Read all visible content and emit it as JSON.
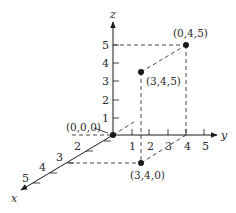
{
  "diagram": {
    "type": "3d-coordinate-system",
    "colors": {
      "ink": "#1a1a1a",
      "background": "#ffffff"
    },
    "axes": {
      "x": {
        "label": "x",
        "ticks": [
          "2",
          "3",
          "4",
          "5"
        ]
      },
      "y": {
        "label": "y",
        "ticks": [
          "1",
          "2",
          "3",
          "4",
          "5"
        ]
      },
      "z": {
        "label": "z",
        "ticks": [
          "1",
          "2",
          "3",
          "4",
          "5"
        ]
      }
    },
    "points": [
      {
        "label": "(0,0,0)",
        "coords": [
          0,
          0,
          0
        ]
      },
      {
        "label": "(0,4,5)",
        "coords": [
          0,
          4,
          5
        ]
      },
      {
        "label": "(3,4,5)",
        "coords": [
          3,
          4,
          5
        ]
      },
      {
        "label": "(3,4,0)",
        "coords": [
          3,
          4,
          0
        ]
      }
    ]
  }
}
